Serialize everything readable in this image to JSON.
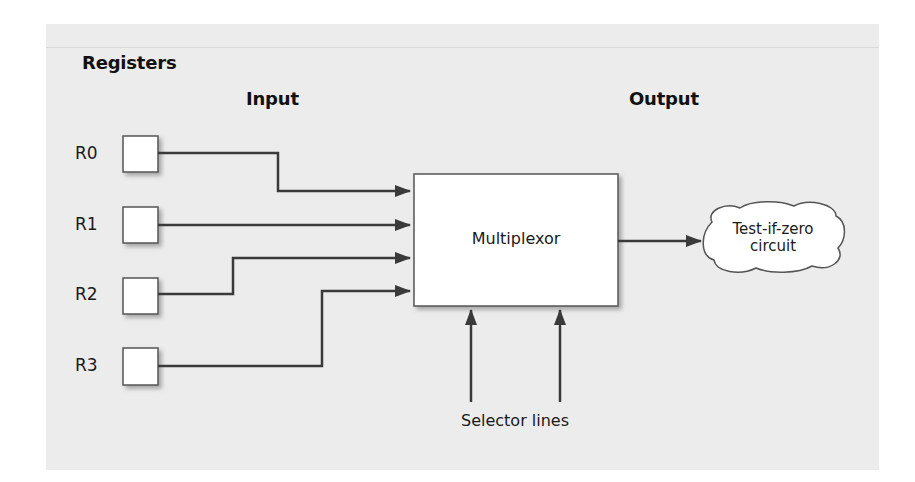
{
  "headings": {
    "registers": "Registers",
    "input": "Input",
    "output": "Output"
  },
  "registers": [
    {
      "label": "R0"
    },
    {
      "label": "R1"
    },
    {
      "label": "R2"
    },
    {
      "label": "R3"
    }
  ],
  "multiplexor": {
    "label": "Multiplexor"
  },
  "output_target": {
    "line1": "Test-if-zero",
    "line2": "circuit"
  },
  "selector": {
    "label": "Selector lines"
  },
  "colors": {
    "panel": "#ececec",
    "line": "#3a3a3a",
    "box_fill": "#ffffff",
    "box_border": "#555555"
  }
}
